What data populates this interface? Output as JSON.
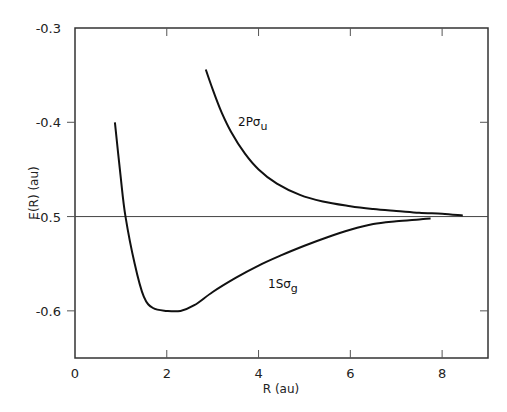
{
  "chart_data": {
    "type": "line",
    "title": "",
    "xlabel": "R (au)",
    "ylabel": "E(R) (au)",
    "xlim": [
      0,
      9
    ],
    "ylim": [
      -0.65,
      -0.3
    ],
    "x_ticks": [
      0,
      2,
      4,
      6,
      8
    ],
    "x_tick_labels": [
      "0",
      "2",
      "4",
      "6",
      "8"
    ],
    "y_ticks": [
      -0.3,
      -0.4,
      -0.5,
      -0.6
    ],
    "y_tick_labels": [
      "-0.3",
      "-0.4",
      "-0.5",
      "-0.6"
    ],
    "grid": false,
    "reference_line": {
      "y": -0.5
    },
    "series": [
      {
        "name": "1Sσg",
        "label_main": "1Sσ",
        "label_sub": "g",
        "x": [
          0.87,
          1.0,
          1.1,
          1.3,
          1.5,
          1.7,
          2.0,
          2.3,
          2.6,
          3.0,
          3.5,
          4.0,
          4.5,
          5.0,
          5.5,
          6.0,
          6.5,
          7.0,
          7.5,
          7.75
        ],
        "y": [
          -0.4,
          -0.46,
          -0.5,
          -0.55,
          -0.585,
          -0.597,
          -0.6,
          -0.6,
          -0.594,
          -0.58,
          -0.565,
          -0.552,
          -0.541,
          -0.531,
          -0.522,
          -0.514,
          -0.508,
          -0.505,
          -0.503,
          -0.502
        ]
      },
      {
        "name": "2Pσu",
        "label_main": "2Pσ",
        "label_sub": "u",
        "x": [
          2.85,
          3.0,
          3.2,
          3.4,
          3.7,
          4.0,
          4.4,
          4.9,
          5.4,
          6.0,
          6.5,
          7.0,
          7.5,
          8.0,
          8.45
        ],
        "y": [
          -0.344,
          -0.365,
          -0.39,
          -0.41,
          -0.433,
          -0.45,
          -0.465,
          -0.477,
          -0.484,
          -0.489,
          -0.492,
          -0.494,
          -0.496,
          -0.497,
          -0.499
        ]
      }
    ]
  },
  "labels": {
    "xlabel": "R (au)",
    "ylabel": "E(R) (au)",
    "s1_main": "1Sσ",
    "s1_sub": "g",
    "s2_main": "2Pσ",
    "s2_sub": "u"
  }
}
